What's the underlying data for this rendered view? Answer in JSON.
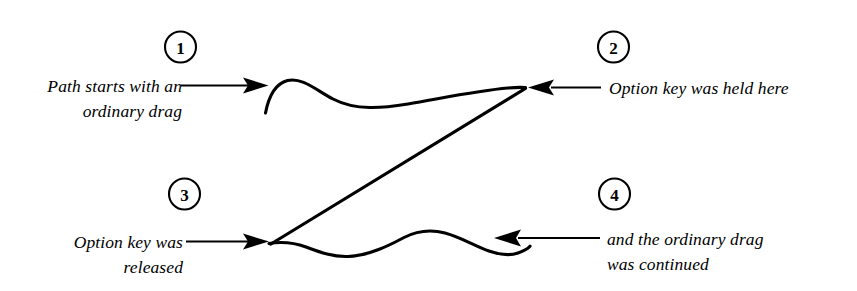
{
  "figure": {
    "background_color": "#ffffff",
    "ink_color": "#000000"
  },
  "callouts": [
    {
      "number": "1",
      "badge_name": "step-badge-1",
      "label": "Path starts with an\nordinary drag",
      "align": "right",
      "arrow_direction": "right",
      "points_to": "path-start-point"
    },
    {
      "number": "2",
      "badge_name": "step-badge-2",
      "label": "Option key was held here",
      "align": "left",
      "arrow_direction": "left",
      "points_to": "option-held-point"
    },
    {
      "number": "3",
      "badge_name": "step-badge-3",
      "label": "Option key was\nreleased",
      "align": "right",
      "arrow_direction": "right",
      "points_to": "option-released-point"
    },
    {
      "number": "4",
      "badge_name": "step-badge-4",
      "label": "and the ordinary drag\nwas continued",
      "align": "left",
      "arrow_direction": "left",
      "points_to": "path-end-point"
    }
  ],
  "drawing": {
    "upper_curve_name": "upper-freehand-curve",
    "straight_segment_name": "option-constrained-straight-segment",
    "lower_curve_name": "lower-freehand-curve"
  }
}
